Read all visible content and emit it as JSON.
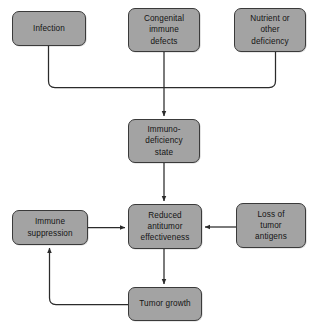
{
  "diagram": {
    "type": "flowchart",
    "background_color": "#ffffff",
    "node_fill_color": "#a3a3a3",
    "node_border_color": "#3a3a3a",
    "text_color": "#141414",
    "edge_color": "#2b2b2b",
    "nodes": [
      {
        "id": "infection",
        "label": "Infection",
        "x": 12,
        "y": 11,
        "width": 74,
        "height": 35
      },
      {
        "id": "congenital-immune-defects",
        "label": "Congenital\nimmune\ndefects",
        "x": 128,
        "y": 8,
        "width": 72,
        "height": 44
      },
      {
        "id": "nutrient-or-other-deficiency",
        "label": "Nutrient or\nother\ndeficiency",
        "x": 234,
        "y": 8,
        "width": 72,
        "height": 44
      },
      {
        "id": "immunodeficiency-state",
        "label": "Immuno-\ndeficiency\nstate",
        "x": 128,
        "y": 119,
        "width": 72,
        "height": 44
      },
      {
        "id": "immune-suppression",
        "label": "Immune\nsuppression",
        "x": 12,
        "y": 210,
        "width": 76,
        "height": 35
      },
      {
        "id": "reduced-antitumor-effectiveness",
        "label": "Reduced\nantitumor\neffectiveness",
        "x": 128,
        "y": 204,
        "width": 74,
        "height": 45
      },
      {
        "id": "loss-of-tumor-antigens",
        "label": "Loss of\ntumor\nantigens",
        "x": 236,
        "y": 203,
        "width": 70,
        "height": 45
      },
      {
        "id": "tumor-growth",
        "label": "Tumor growth",
        "x": 128,
        "y": 287,
        "width": 74,
        "height": 34
      }
    ],
    "edges": [
      {
        "id": "infection-to-bus",
        "from": "infection",
        "to": "immunodeficiency-state",
        "style": "orthogonal"
      },
      {
        "id": "congenital-to-immunodeficiency",
        "from": "congenital-immune-defects",
        "to": "immunodeficiency-state",
        "style": "straight-arrow"
      },
      {
        "id": "nutrient-to-bus",
        "from": "nutrient-or-other-deficiency",
        "to": "immunodeficiency-state",
        "style": "orthogonal"
      },
      {
        "id": "immunodeficiency-to-reduced",
        "from": "immunodeficiency-state",
        "to": "reduced-antitumor-effectiveness",
        "style": "straight-arrow"
      },
      {
        "id": "immune-suppression-to-reduced",
        "from": "immune-suppression",
        "to": "reduced-antitumor-effectiveness",
        "style": "straight-arrow"
      },
      {
        "id": "loss-antigens-to-reduced",
        "from": "loss-of-tumor-antigens",
        "to": "reduced-antitumor-effectiveness",
        "style": "straight-arrow"
      },
      {
        "id": "reduced-to-tumor-growth",
        "from": "reduced-antitumor-effectiveness",
        "to": "tumor-growth",
        "style": "straight-arrow"
      },
      {
        "id": "tumor-growth-to-immune-suppression",
        "from": "tumor-growth",
        "to": "immune-suppression",
        "style": "orthogonal-feedback"
      }
    ]
  }
}
